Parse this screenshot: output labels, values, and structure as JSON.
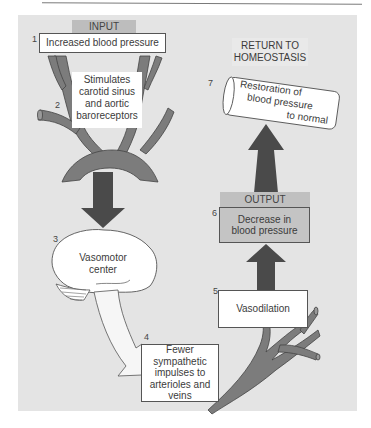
{
  "diagram": {
    "colors": {
      "panel_bg": "#e4e4e4",
      "vessel": "#7c7c7c",
      "arrow_dark": "#4a4a4a",
      "tag_bg": "#bdbdbd",
      "output_box_bg": "#c4c4c4",
      "box_bg": "#ffffff"
    },
    "tags": {
      "input": "INPUT",
      "output": "OUTPUT",
      "homeostasis_line1": "RETURN TO",
      "homeostasis_line2": "HOMEOSTASIS"
    },
    "steps": [
      {
        "num": "1",
        "text": "Increased blood pressure"
      },
      {
        "num": "2",
        "lines": [
          "Stimulates",
          "carotid sinus",
          "and aortic",
          "baroreceptors"
        ]
      },
      {
        "num": "3",
        "lines": [
          "Vasomotor",
          "center"
        ]
      },
      {
        "num": "4",
        "lines": [
          "Fewer",
          "sympathetic",
          "impulses to",
          "arterioles and",
          "veins"
        ]
      },
      {
        "num": "5",
        "text": "Vasodilation"
      },
      {
        "num": "6",
        "lines": [
          "Decrease in",
          "blood pressure"
        ]
      },
      {
        "num": "7",
        "lines": [
          "Restoration of",
          "blood pressure",
          "to normal"
        ]
      }
    ]
  }
}
